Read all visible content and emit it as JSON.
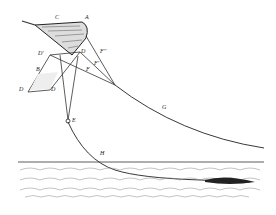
{
  "labels": {
    "C": "C",
    "A": "A",
    "D1": "D'",
    "D2": "D",
    "F2": "F''",
    "F1": "F'",
    "F": "F",
    "B": "B",
    "D3": "D",
    "D4": "D",
    "E": "E",
    "G": "G",
    "H": "H"
  }
}
